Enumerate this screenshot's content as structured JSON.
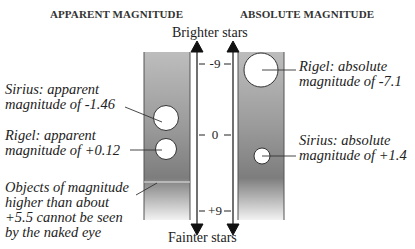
{
  "diagram": {
    "headings": {
      "left": "APPARENT MAGNITUDE",
      "right": "ABSOLUTE MAGNITUDE"
    },
    "axis": {
      "top_label": "Brighter stars",
      "bottom_label": "Fainter stars",
      "ticks": [
        "-9",
        "0",
        "+9"
      ]
    },
    "annotations": {
      "sirius_apparent": [
        "Sirius: apparent",
        "magnitude of -1.46"
      ],
      "rigel_apparent": [
        "Rigel: apparent",
        "magnitude of +0.12"
      ],
      "naked_eye_limit": [
        "Objects of magnitude",
        "higher than about",
        "+5.5 cannot be seen",
        "by the naked eye"
      ],
      "rigel_absolute": [
        "Rigel: absolute",
        "magnitude of -7.1"
      ],
      "sirius_absolute": [
        "Sirius: absolute",
        "magnitude of +1.4"
      ]
    },
    "colors": {
      "panel_top": "#b8b8b8",
      "panel_mid": "#8a8a8a",
      "panel_bottom": "#f0f0f0",
      "arrow": "#111111"
    }
  }
}
